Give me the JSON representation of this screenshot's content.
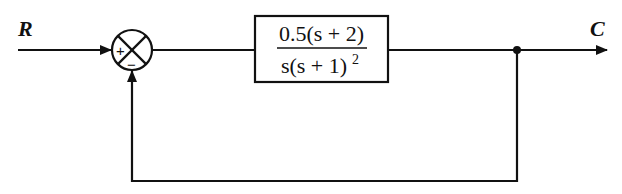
{
  "diagram": {
    "type": "feedback-control-block-diagram",
    "input_label": "R",
    "output_label": "C",
    "summing_junction": {
      "plus_sign": "+",
      "minus_sign": "−"
    },
    "forward_block": {
      "numerator": "0.5(s + 2)",
      "denominator_base": "s(s + 1)",
      "denominator_exponent": "2"
    },
    "feedback": "unity negative feedback"
  }
}
